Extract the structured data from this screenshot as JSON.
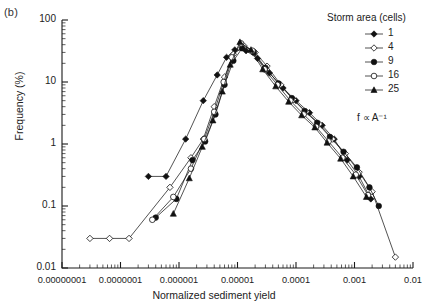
{
  "panel": {
    "label": "(b)"
  },
  "legend": {
    "title": "Storm area (cells)",
    "note": "f ∝ A⁻¹",
    "entries": [
      {
        "label": "1",
        "marker": "filled-diamond"
      },
      {
        "label": "4",
        "marker": "open-diamond"
      },
      {
        "label": "9",
        "marker": "filled-circle"
      },
      {
        "label": "16",
        "marker": "open-circle"
      },
      {
        "label": "25",
        "marker": "filled-triangle"
      }
    ]
  },
  "chart_data": {
    "type": "line",
    "title": "",
    "xlabel": "Normalized sediment yield",
    "ylabel": "Frequency (%)",
    "xscale": "log",
    "yscale": "log",
    "xlim": [
      1e-08,
      0.01
    ],
    "ylim": [
      0.01,
      100
    ],
    "grid": false,
    "legend_position": "top-right",
    "xtick_labels": [
      "0.00000001",
      "0.0000001",
      "0.000001",
      "0.00001",
      "0.0001",
      "0.001",
      "0.01"
    ],
    "xtick_values": [
      1e-08,
      1e-07,
      1e-06,
      1e-05,
      0.0001,
      0.001,
      0.01
    ],
    "ytick_labels": [
      "100",
      "10",
      "1",
      "0.1",
      "0.01"
    ],
    "ytick_values": [
      100,
      10,
      1,
      0.1,
      0.01
    ],
    "annotation": "f ∝ A⁻¹",
    "series": [
      {
        "name": "1",
        "marker": "filled-diamond",
        "x": [
          3e-07,
          6e-07,
          1.3e-06,
          2.6e-06,
          4.5e-06,
          6.5e-06,
          9e-06,
          1.4e-05,
          2.2e-05,
          3.5e-05,
          6e-05,
          0.0001,
          0.00017,
          0.00028,
          0.00045,
          0.00075,
          0.0012,
          0.0019
        ],
        "y": [
          0.3,
          0.3,
          1.2,
          5.0,
          13.0,
          25.0,
          33.0,
          32.0,
          24.0,
          14.0,
          8.0,
          5.0,
          3.2,
          2.0,
          1.2,
          0.55,
          0.3,
          0.13
        ]
      },
      {
        "name": "4",
        "marker": "open-diamond",
        "x": [
          3e-08,
          6.5e-08,
          1.4e-07,
          7e-07,
          1.6e-06,
          2.6e-06,
          4e-06,
          6e-06,
          8.5e-06,
          1.3e-05,
          2e-05,
          3.2e-05,
          5.5e-05,
          9e-05,
          0.00015,
          0.00025,
          0.00042,
          0.0007,
          0.0012,
          0.002,
          0.005
        ],
        "y": [
          0.03,
          0.03,
          0.03,
          0.2,
          0.6,
          1.2,
          4.0,
          12.0,
          28.0,
          38.0,
          30.0,
          18.0,
          9.0,
          5.2,
          3.3,
          2.1,
          1.2,
          0.7,
          0.35,
          0.17,
          0.015
        ]
      },
      {
        "name": "9",
        "marker": "filled-circle",
        "x": [
          4e-07,
          9e-07,
          1.7e-06,
          2.8e-06,
          4.2e-06,
          6e-06,
          8.5e-06,
          1.2e-05,
          1.9e-05,
          3e-05,
          5e-05,
          8.5e-05,
          0.00014,
          0.00023,
          0.00038,
          0.00065,
          0.0011,
          0.0018,
          0.0026
        ],
        "y": [
          0.065,
          0.13,
          0.55,
          1.1,
          3.0,
          9.0,
          22.0,
          35.0,
          30.0,
          17.0,
          9.5,
          5.5,
          3.4,
          2.2,
          1.3,
          0.75,
          0.42,
          0.2,
          0.1
        ]
      },
      {
        "name": "16",
        "marker": "open-circle",
        "x": [
          3.5e-07,
          8e-07,
          1.6e-06,
          2.7e-06,
          4e-06,
          5.8e-06,
          8e-06,
          1.15e-05,
          1.8e-05,
          2.9e-05,
          4.8e-05,
          8e-05,
          0.000135,
          0.00022,
          0.00036,
          0.00062,
          0.00105,
          0.0017
        ],
        "y": [
          0.06,
          0.14,
          0.4,
          1.2,
          3.3,
          10.0,
          25.0,
          42.0,
          32.0,
          16.0,
          9.0,
          5.0,
          3.0,
          1.9,
          1.1,
          0.6,
          0.32,
          0.15
        ]
      },
      {
        "name": "25",
        "marker": "filled-triangle",
        "x": [
          8e-07,
          1.5e-06,
          2.5e-06,
          3.8e-06,
          5.5e-06,
          7.5e-06,
          1.1e-05,
          1.7e-05,
          2.7e-05,
          4.5e-05,
          7.5e-05,
          0.000125,
          0.00021,
          0.00034,
          0.00058,
          0.00095,
          0.0016
        ],
        "y": [
          0.075,
          0.28,
          0.9,
          2.4,
          7.0,
          19.0,
          44.0,
          33.0,
          16.0,
          8.5,
          4.8,
          2.9,
          1.85,
          1.05,
          0.58,
          0.3,
          0.14
        ]
      }
    ]
  }
}
